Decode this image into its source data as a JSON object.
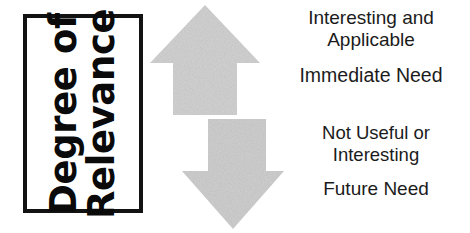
{
  "diagram": {
    "title": "Degree of Relevance",
    "axis": {
      "label_line1": "Degree of",
      "label_line2": "Relevance",
      "border_color": "#121212",
      "text_color": "#0a0a0a"
    },
    "arrows": [
      {
        "id": "arrow-up",
        "direction": "up",
        "fill_color": "#d2d2d2",
        "meaning": "high relevance"
      },
      {
        "id": "arrow-down",
        "direction": "down",
        "fill_color": "#cfcfcf",
        "meaning": "low relevance"
      }
    ],
    "labels": {
      "top": {
        "primary_line1": "Interesting and",
        "primary_line2": "Applicable",
        "secondary": "Immediate Need"
      },
      "bottom": {
        "primary_line1": "Not Useful or",
        "primary_line2": "Interesting",
        "secondary": "Future Need"
      }
    },
    "text_color": "#1b1b1b"
  }
}
